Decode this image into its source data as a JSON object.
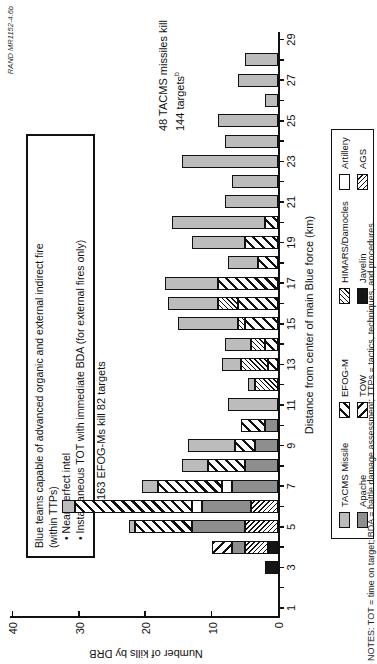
{
  "figure_id": "RAND MR1152-4.6b",
  "info_box": {
    "line1": "Blue teams capable of advanced organic and external indirect fire",
    "line2": "(within TTPs)",
    "bullets": [
      "Near-perfect intel",
      "Instantaneous TOT with immediate BDA (for external fires only)"
    ]
  },
  "annotations": {
    "efog_text": "163 EFOG-Ms kill 82 targets",
    "tacms_line1": "48 TACMS missiles kill",
    "tacms_line2": "144 targets",
    "tacms_sup": "b"
  },
  "notes": "NOTES: TOT = time on target; BDA = battle damage assessment; TTPs = tactics, techniques, and procedures.",
  "legend": {
    "rows": [
      [
        {
          "label": "TACMS Missile",
          "key": "tacms"
        },
        {
          "label": "EFOG-M",
          "key": "efog"
        },
        {
          "label": "HIMARS/Damocles",
          "key": "himars"
        },
        {
          "label": "Artillery",
          "key": "artillery"
        }
      ],
      [
        {
          "label": "Apache",
          "key": "apache"
        },
        {
          "label": "TOW",
          "key": "tow"
        },
        {
          "label": "Javelin",
          "key": "javelin"
        },
        {
          "label": "AGS",
          "key": "ags"
        }
      ]
    ]
  },
  "colors": {
    "tacms_light_gray": "#bcbcbc",
    "apache_dark_gray": "#8e8e8e",
    "javelin_black": "#151515",
    "ink": "#111111",
    "background": "#ffffff"
  },
  "chart_data": {
    "type": "bar",
    "stacked": true,
    "title": "",
    "xlabel": "Distance from center of main Blue force (km)",
    "ylabel": "Number of kills by DRB",
    "xlim": [
      0,
      30
    ],
    "ylim": [
      0,
      40
    ],
    "yticks": [
      0,
      10,
      20,
      30,
      40
    ],
    "xticks_labeled": [
      1,
      3,
      5,
      7,
      9,
      11,
      13,
      15,
      17,
      19,
      21,
      23,
      25,
      27,
      29
    ],
    "xticks_minor_every": 1,
    "grid": false,
    "legend_position": "bottom",
    "series_stack_order": [
      "Javelin",
      "AGS",
      "Apache",
      "TOW",
      "Artillery",
      "EFOG-M",
      "HIMARS/Damocles",
      "TACMS Missile"
    ],
    "bars": [
      {
        "x": 3,
        "segments": [
          {
            "series": "Javelin",
            "kills": 2
          }
        ]
      },
      {
        "x": 4,
        "segments": [
          {
            "series": "Javelin",
            "kills": 1.5
          },
          {
            "series": "AGS",
            "kills": 3.5
          },
          {
            "series": "Apache",
            "kills": 2
          },
          {
            "series": "TOW",
            "kills": 3
          }
        ]
      },
      {
        "x": 5,
        "segments": [
          {
            "series": "AGS",
            "kills": 5
          },
          {
            "series": "Apache",
            "kills": 8
          },
          {
            "series": "EFOG-M",
            "kills": 8.5
          },
          {
            "series": "TACMS Missile",
            "kills": 1
          }
        ]
      },
      {
        "x": 6,
        "segments": [
          {
            "series": "AGS",
            "kills": 4
          },
          {
            "series": "Apache",
            "kills": 7.5
          },
          {
            "series": "Artillery",
            "kills": 1.5
          },
          {
            "series": "EFOG-M",
            "kills": 17.5
          },
          {
            "series": "TACMS Missile",
            "kills": 2
          }
        ]
      },
      {
        "x": 7,
        "segments": [
          {
            "series": "Apache",
            "kills": 7
          },
          {
            "series": "Artillery",
            "kills": 1.5
          },
          {
            "series": "EFOG-M",
            "kills": 9.5
          },
          {
            "series": "TACMS Missile",
            "kills": 2.5
          }
        ]
      },
      {
        "x": 8,
        "segments": [
          {
            "series": "Apache",
            "kills": 5
          },
          {
            "series": "EFOG-M",
            "kills": 5.5
          },
          {
            "series": "TACMS Missile",
            "kills": 4
          }
        ]
      },
      {
        "x": 9,
        "segments": [
          {
            "series": "Apache",
            "kills": 3.5
          },
          {
            "series": "EFOG-M",
            "kills": 3
          },
          {
            "series": "TACMS Missile",
            "kills": 7
          }
        ]
      },
      {
        "x": 10,
        "segments": [
          {
            "series": "Apache",
            "kills": 2
          },
          {
            "series": "EFOG-M",
            "kills": 3.5
          }
        ]
      },
      {
        "x": 11,
        "segments": [
          {
            "series": "TACMS Missile",
            "kills": 7.5
          }
        ]
      },
      {
        "x": 12,
        "segments": [
          {
            "series": "HIMARS/Damocles",
            "kills": 3.5
          },
          {
            "series": "TACMS Missile",
            "kills": 1
          }
        ]
      },
      {
        "x": 13,
        "segments": [
          {
            "series": "EFOG-M",
            "kills": 1.5
          },
          {
            "series": "HIMARS/Damocles",
            "kills": 4
          },
          {
            "series": "TACMS Missile",
            "kills": 3
          }
        ]
      },
      {
        "x": 14,
        "segments": [
          {
            "series": "EFOG-M",
            "kills": 2
          },
          {
            "series": "HIMARS/Damocles",
            "kills": 2
          },
          {
            "series": "TACMS Missile",
            "kills": 4
          }
        ]
      },
      {
        "x": 15,
        "segments": [
          {
            "series": "EFOG-M",
            "kills": 5
          },
          {
            "series": "HIMARS/Damocles",
            "kills": 1
          },
          {
            "series": "TACMS Missile",
            "kills": 9
          }
        ]
      },
      {
        "x": 16,
        "segments": [
          {
            "series": "EFOG-M",
            "kills": 6
          },
          {
            "series": "HIMARS/Damocles",
            "kills": 3
          },
          {
            "series": "TACMS Missile",
            "kills": 7.5
          }
        ]
      },
      {
        "x": 17,
        "segments": [
          {
            "series": "EFOG-M",
            "kills": 9
          },
          {
            "series": "TACMS Missile",
            "kills": 8
          }
        ]
      },
      {
        "x": 18,
        "segments": [
          {
            "series": "EFOG-M",
            "kills": 3
          },
          {
            "series": "TACMS Missile",
            "kills": 4.5
          }
        ]
      },
      {
        "x": 19,
        "segments": [
          {
            "series": "EFOG-M",
            "kills": 5
          },
          {
            "series": "TACMS Missile",
            "kills": 8
          }
        ]
      },
      {
        "x": 20,
        "segments": [
          {
            "series": "EFOG-M",
            "kills": 2
          },
          {
            "series": "TACMS Missile",
            "kills": 14
          }
        ]
      },
      {
        "x": 21,
        "segments": [
          {
            "series": "TACMS Missile",
            "kills": 8
          }
        ]
      },
      {
        "x": 22,
        "segments": [
          {
            "series": "TACMS Missile",
            "kills": 7
          }
        ]
      },
      {
        "x": 23,
        "segments": [
          {
            "series": "TACMS Missile",
            "kills": 14.5
          }
        ]
      },
      {
        "x": 24,
        "segments": [
          {
            "series": "TACMS Missile",
            "kills": 8
          }
        ]
      },
      {
        "x": 25,
        "segments": [
          {
            "series": "TACMS Missile",
            "kills": 9
          }
        ]
      },
      {
        "x": 26,
        "segments": [
          {
            "series": "TACMS Missile",
            "kills": 2
          }
        ]
      },
      {
        "x": 27,
        "segments": [
          {
            "series": "TACMS Missile",
            "kills": 6
          }
        ]
      },
      {
        "x": 28,
        "segments": [
          {
            "series": "TACMS Missile",
            "kills": 5
          }
        ]
      }
    ]
  }
}
